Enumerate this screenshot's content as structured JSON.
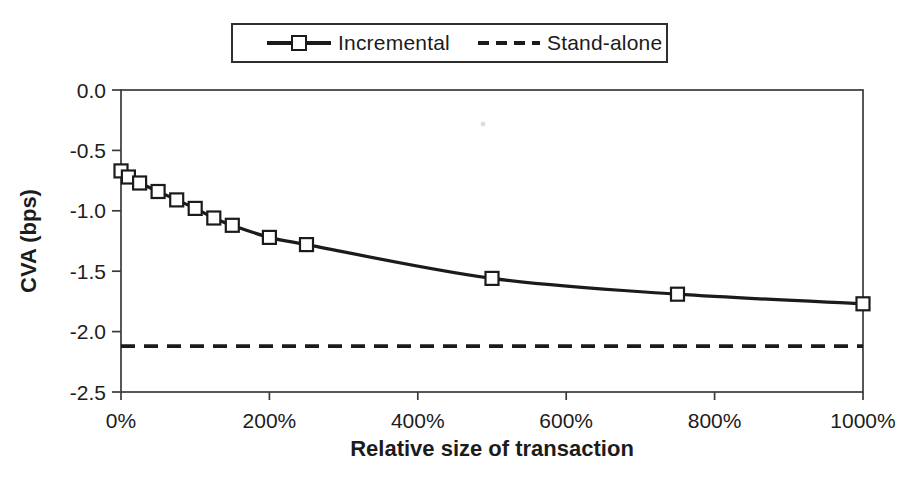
{
  "colors": {
    "ink": "#1b1b1b",
    "frame": "#3a3a3a",
    "background": "#ffffff"
  },
  "legend": {
    "items": [
      {
        "label": "Incremental",
        "line_style": "solid",
        "marker": "open-square"
      },
      {
        "label": "Stand-alone",
        "line_style": "dashed",
        "marker": "none"
      }
    ]
  },
  "chart_data": {
    "type": "line",
    "title": "",
    "xlabel": "Relative size of transaction",
    "ylabel": "CVA (bps)",
    "xlim": [
      0,
      1000
    ],
    "ylim": [
      -2.5,
      0
    ],
    "grid": false,
    "legend_position": "top-center",
    "x_ticks": {
      "values": [
        0,
        200,
        400,
        600,
        800,
        1000
      ],
      "labels": [
        "0%",
        "200%",
        "400%",
        "600%",
        "800%",
        "1000%"
      ]
    },
    "y_ticks": {
      "values": [
        0,
        -0.5,
        -1.0,
        -1.5,
        -2.0,
        -2.5
      ],
      "labels": [
        "0.0",
        "-0.5",
        "-1.0",
        "-1.5",
        "-2.0",
        "-2.5"
      ]
    },
    "series": [
      {
        "name": "Incremental",
        "style": "solid",
        "marker": "open-square",
        "x": [
          0,
          10,
          25,
          50,
          75,
          100,
          125,
          150,
          200,
          250,
          500,
          750,
          1000
        ],
        "y": [
          -0.67,
          -0.72,
          -0.77,
          -0.84,
          -0.91,
          -0.98,
          -1.06,
          -1.12,
          -1.22,
          -1.28,
          -1.56,
          -1.69,
          -1.77
        ]
      },
      {
        "name": "Stand-alone",
        "style": "dashed",
        "marker": "none",
        "constant_y": -2.12
      }
    ]
  }
}
